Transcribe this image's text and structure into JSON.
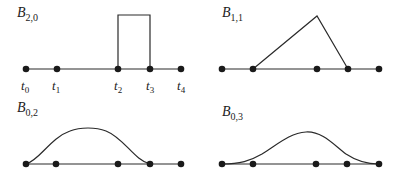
{
  "panels": [
    {
      "id": "B20",
      "label": {
        "base": "B",
        "sub": "2,0"
      },
      "knot_labels": [
        "t",
        "t",
        "t",
        "t",
        "t"
      ],
      "knot_subs": [
        "0",
        "1",
        "2",
        "3",
        "4"
      ],
      "shape": "box"
    },
    {
      "id": "B11",
      "label": {
        "base": "B",
        "sub": "1,1"
      },
      "shape": "triangle"
    },
    {
      "id": "B02",
      "label": {
        "base": "B",
        "sub": "0,2"
      },
      "shape": "quadratic-bump"
    },
    {
      "id": "B03",
      "label": {
        "base": "B",
        "sub": "0,3"
      },
      "shape": "cubic-bump"
    }
  ],
  "colors": {
    "line": "#2a2a2a",
    "dot": "#1a1a1a"
  }
}
